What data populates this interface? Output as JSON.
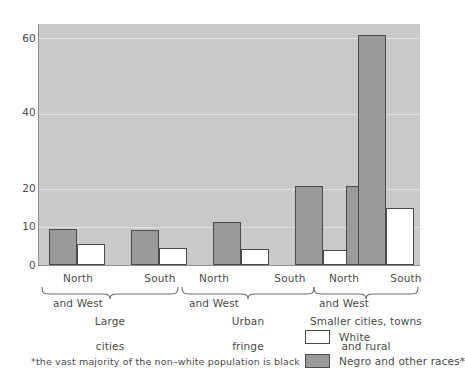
{
  "chart_data": {
    "type": "bar",
    "title": "",
    "subtitle": "",
    "xlabel": "",
    "ylabel": "",
    "ylim": [
      0,
      63.8
    ],
    "yticks": [
      0,
      10,
      20,
      40,
      60
    ],
    "ytick_labels": [
      "0",
      "10",
      "20",
      "40",
      "60"
    ],
    "grid": true,
    "grid_axis": "y",
    "legend_position": "bottom-right",
    "categories": [
      "North and West",
      "South",
      "North and West",
      "South",
      "North and West",
      "South"
    ],
    "category_lines": [
      [
        "North",
        "and West"
      ],
      [
        "South"
      ],
      [
        "North",
        "and West"
      ],
      [
        "South"
      ],
      [
        "North",
        "and West"
      ],
      [
        "South"
      ]
    ],
    "groups": [
      {
        "label": "Large\ncities",
        "label_lines": [
          "Large",
          "cities"
        ],
        "categories": [
          "North and West",
          "South"
        ]
      },
      {
        "label": "Urban\nfringe",
        "label_lines": [
          "Urban",
          "fringe"
        ],
        "categories": [
          "North and West",
          "South"
        ]
      },
      {
        "label": "Smaller cities, towns\nand rural",
        "label_lines": [
          "Smaller cities, towns",
          "and rural"
        ],
        "categories": [
          "North and West",
          "South"
        ]
      }
    ],
    "series": [
      {
        "name": "Negro and other races*",
        "color": "#9a9a9a",
        "values": [
          9.5,
          9.3,
          11.5,
          21.0,
          21.0,
          61.0
        ]
      },
      {
        "name": "White",
        "color": "#ffffff",
        "values": [
          5.5,
          4.5,
          4.3,
          4.0,
          7.0,
          15.0
        ]
      }
    ],
    "plot_background": "#c9c9c9",
    "gridline_color": "#e2e2e2",
    "bar_edge_color": "#4a4a4a",
    "annotations": [
      "*the vast majority of the non-white population is black"
    ]
  },
  "legend": {
    "items": [
      {
        "label": "White",
        "swatch": "white"
      },
      {
        "label": "Negro and other races*",
        "swatch": "negro"
      }
    ]
  },
  "footnote": {
    "text": "*the vast majority of the non–white population is black"
  }
}
